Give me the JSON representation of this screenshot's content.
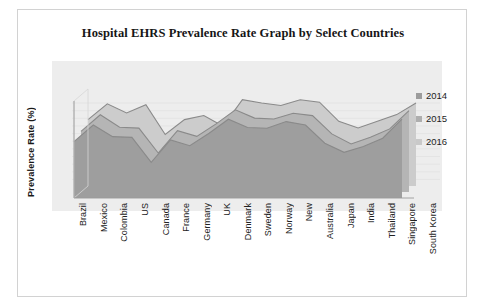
{
  "card": {
    "title": "Hospital EHRS Prevalence Rate Graph by Select Countries"
  },
  "chart_data": {
    "type": "area",
    "title": "Hospital EHRS Prevalence Rate Graph by Select Countries",
    "xlabel": "",
    "ylabel": "Prevalence Rate (%)",
    "ylim": [
      0,
      100
    ],
    "yticks": [
      "0",
      "20",
      "40",
      "60",
      "80",
      "100"
    ],
    "grid": true,
    "legend_position": "right",
    "stacked": false,
    "three_d": true,
    "categories": [
      "Brazil",
      "Mexico",
      "Colombia",
      "US",
      "Canada",
      "France",
      "Germany",
      "UK",
      "Denmark",
      "Sweden",
      "Norway",
      "New",
      "Australia",
      "Japan",
      "India",
      "Thailand",
      "Singapore",
      "South Korea"
    ],
    "series": [
      {
        "name": "2014",
        "color": "#9e9e9e",
        "values": [
          68,
          88,
          74,
          73,
          43,
          70,
          63,
          78,
          95,
          85,
          84,
          92,
          88,
          66,
          55,
          62,
          72,
          95
        ]
      },
      {
        "name": "2015",
        "color": "#b5b5b5",
        "values": [
          73,
          93,
          78,
          77,
          47,
          74,
          67,
          82,
          99,
          89,
          88,
          95,
          92,
          70,
          58,
          66,
          76,
          98
        ]
      },
      {
        "name": "2016",
        "color": "#cccccc",
        "values": [
          80,
          99,
          88,
          98,
          62,
          80,
          85,
          72,
          104,
          100,
          97,
          104,
          101,
          78,
          70,
          78,
          86,
          100
        ]
      }
    ]
  },
  "legend": {
    "items": [
      {
        "label": "2014",
        "color": "#9c9c9c"
      },
      {
        "label": "2015",
        "color": "#aeaeae"
      },
      {
        "label": "2016",
        "color": "#c9c9c9"
      }
    ]
  }
}
